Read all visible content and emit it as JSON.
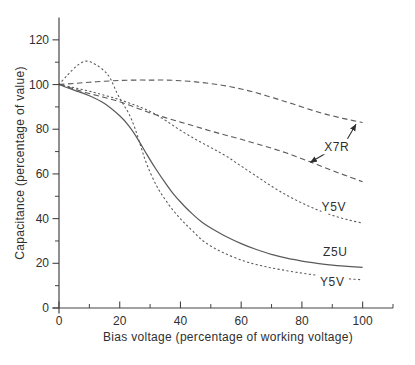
{
  "figure": {
    "width": 415,
    "height": 365,
    "background": "#ffffff",
    "axis_color": "#454545",
    "text_color": "#2f2f2f",
    "curve_color": "#5a5a5a",
    "arrow_color": "#2f2f2f"
  },
  "chart_data": {
    "type": "line",
    "title": "",
    "xlabel": "Bias voltage (percentage of working voltage)",
    "ylabel": "Capacitance (percentage of value)",
    "xlim": [
      0,
      110
    ],
    "ylim": [
      0,
      130
    ],
    "x_major_ticks": [
      0,
      20,
      40,
      60,
      80,
      100
    ],
    "x_minor_ticks": [
      10,
      30,
      50,
      70,
      90,
      110
    ],
    "y_major_ticks": [
      0,
      20,
      40,
      60,
      80,
      100,
      120
    ],
    "y_minor_ticks": [
      10,
      30,
      50,
      70,
      90,
      110
    ],
    "grid": false,
    "legend_position": "inline-labels",
    "series": [
      {
        "name": "X7R upper",
        "dielectric": "X7R",
        "line_style": "dashed",
        "points": [
          [
            0,
            100
          ],
          [
            5,
            100.5
          ],
          [
            10,
            101
          ],
          [
            15,
            101.5
          ],
          [
            20,
            101.8
          ],
          [
            25,
            102
          ],
          [
            30,
            102
          ],
          [
            35,
            102
          ],
          [
            40,
            101.7
          ],
          [
            45,
            101.2
          ],
          [
            50,
            100.4
          ],
          [
            55,
            99.4
          ],
          [
            60,
            98
          ],
          [
            65,
            96.3
          ],
          [
            70,
            94.3
          ],
          [
            75,
            92.2
          ],
          [
            80,
            90
          ],
          [
            85,
            87.8
          ],
          [
            90,
            86
          ],
          [
            95,
            84.4
          ],
          [
            100,
            83
          ]
        ]
      },
      {
        "name": "X7R lower",
        "dielectric": "X7R",
        "line_style": "dashed",
        "points": [
          [
            0,
            100
          ],
          [
            5,
            98
          ],
          [
            10,
            96
          ],
          [
            15,
            94.2
          ],
          [
            20,
            92.3
          ],
          [
            25,
            89.8
          ],
          [
            30,
            87.3
          ],
          [
            35,
            85.2
          ],
          [
            40,
            83.2
          ],
          [
            45,
            81.2
          ],
          [
            50,
            79.2
          ],
          [
            55,
            77.3
          ],
          [
            60,
            75.5
          ],
          [
            65,
            73.5
          ],
          [
            70,
            71.5
          ],
          [
            75,
            69.3
          ],
          [
            80,
            66.8
          ],
          [
            85,
            64.2
          ],
          [
            90,
            61.5
          ],
          [
            95,
            59
          ],
          [
            100,
            56.5
          ]
        ]
      },
      {
        "name": "Y5V upper",
        "dielectric": "Y5V",
        "line_style": "dotted",
        "label": {
          "text": "Y5V",
          "x": 90.5,
          "y": 45
        },
        "points": [
          [
            0,
            100
          ],
          [
            5,
            98.6
          ],
          [
            10,
            97
          ],
          [
            15,
            95.2
          ],
          [
            20,
            93.2
          ],
          [
            25,
            90.8
          ],
          [
            30,
            88
          ],
          [
            35,
            84
          ],
          [
            40,
            79.5
          ],
          [
            45,
            75.5
          ],
          [
            50,
            71.8
          ],
          [
            55,
            68
          ],
          [
            60,
            63.5
          ],
          [
            65,
            59
          ],
          [
            70,
            54.5
          ],
          [
            75,
            50.5
          ],
          [
            80,
            47
          ],
          [
            85,
            44
          ],
          [
            90,
            41.5
          ],
          [
            95,
            39.5
          ],
          [
            100,
            38
          ]
        ]
      },
      {
        "name": "Z5U",
        "dielectric": "Z5U",
        "line_style": "solid",
        "label": {
          "text": "Z5U",
          "x": 91,
          "y": 25
        },
        "points": [
          [
            0,
            100
          ],
          [
            5,
            97.5
          ],
          [
            10,
            95
          ],
          [
            15,
            91.5
          ],
          [
            20,
            86
          ],
          [
            23,
            81.5
          ],
          [
            26,
            75.5
          ],
          [
            29,
            68.5
          ],
          [
            32,
            62
          ],
          [
            35,
            56
          ],
          [
            38,
            50.5
          ],
          [
            41,
            46
          ],
          [
            44,
            42
          ],
          [
            47,
            38.5
          ],
          [
            50,
            35.8
          ],
          [
            55,
            32
          ],
          [
            60,
            28.8
          ],
          [
            65,
            26.2
          ],
          [
            70,
            24
          ],
          [
            75,
            22.3
          ],
          [
            80,
            21
          ],
          [
            85,
            20
          ],
          [
            90,
            19.2
          ],
          [
            95,
            18.6
          ],
          [
            100,
            18.2
          ]
        ]
      },
      {
        "name": "Y5V lower",
        "dielectric": "Y5V",
        "line_style": "dotted",
        "label": {
          "text": "Y5V",
          "x": 90,
          "y": 11.5
        },
        "points": [
          [
            0,
            100
          ],
          [
            3,
            104.5
          ],
          [
            6,
            108.5
          ],
          [
            9,
            110.5
          ],
          [
            12,
            109
          ],
          [
            15,
            106
          ],
          [
            17,
            102.5
          ],
          [
            19,
            96.5
          ],
          [
            21,
            91.5
          ],
          [
            23,
            87
          ],
          [
            25,
            80.5
          ],
          [
            27,
            72
          ],
          [
            29,
            64
          ],
          [
            32,
            55
          ],
          [
            35,
            48.5
          ],
          [
            38,
            43
          ],
          [
            41,
            38.5
          ],
          [
            44,
            34.5
          ],
          [
            48,
            29.5
          ],
          [
            54,
            24.8
          ],
          [
            61,
            21
          ],
          [
            67,
            18.8
          ],
          [
            73,
            17.2
          ],
          [
            80,
            15.6
          ],
          [
            87,
            14.3
          ],
          [
            94,
            13.2
          ],
          [
            100,
            12.6
          ]
        ]
      }
    ],
    "annotations": [
      {
        "text": "X7R",
        "x": 91.5,
        "y": 72,
        "arrows": [
          {
            "from": [
              94.5,
              74.5
            ],
            "to": [
              97.8,
              82.2
            ]
          },
          {
            "from": [
              88.2,
              69.5
            ],
            "to": [
              82.8,
              65.2
            ]
          }
        ]
      }
    ]
  }
}
